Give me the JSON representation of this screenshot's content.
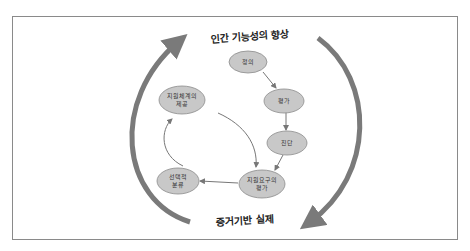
{
  "diagram": {
    "top_label": "인간 기능성의 향상",
    "bottom_label": "증거기반 실제",
    "nodes": [
      {
        "id": "definition",
        "lines": [
          "정의"
        ]
      },
      {
        "id": "assessment",
        "lines": [
          "평가"
        ]
      },
      {
        "id": "diagnosis",
        "lines": [
          "진단"
        ]
      },
      {
        "id": "support-needs",
        "lines": [
          "지원요구의",
          "평가"
        ]
      },
      {
        "id": "classification",
        "lines": [
          "선택적",
          "분류"
        ]
      },
      {
        "id": "support-provision",
        "lines": [
          "지원체계의",
          "제공"
        ]
      }
    ],
    "colors": {
      "node_fill": "#c8c8c8",
      "node_stroke": "#8c8c8c",
      "big_arrow": "#7a7a7a",
      "small_arrow": "#777777",
      "frame": "#8a8a8a"
    }
  }
}
